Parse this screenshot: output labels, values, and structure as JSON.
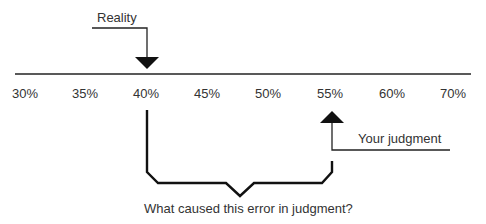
{
  "diagram": {
    "reality_label": "Reality",
    "judgment_label": "Your judgment",
    "question": "What caused this error in judgment?",
    "axis_ticks": [
      "30%",
      "35%",
      "40%",
      "45%",
      "50%",
      "55%",
      "60%",
      "70%"
    ],
    "reality_value": "40%",
    "judgment_value": "55%",
    "line_color": "#111111"
  }
}
